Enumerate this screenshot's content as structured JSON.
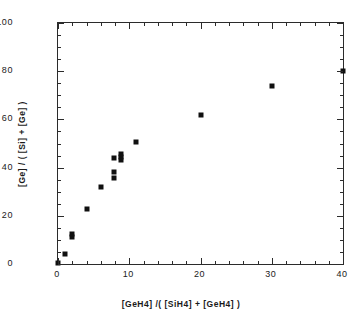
{
  "chart_data": {
    "type": "scatter",
    "title": "",
    "xlabel": "[GeH4] /( [SiH4] + [GeH4] )",
    "ylabel": "[Ge] / ( [Si] + [Ge] )",
    "xlim": [
      0,
      40
    ],
    "ylim": [
      0,
      100
    ],
    "xticks": [
      0,
      10,
      20,
      30,
      40
    ],
    "yticks": [
      0,
      20,
      40,
      60,
      80,
      100
    ],
    "xtick_labels": [
      "0",
      "10",
      "20",
      "30",
      "40"
    ],
    "ytick_labels": [
      "0",
      "20",
      "40",
      "60",
      "80",
      "100"
    ],
    "x_minor_interval": 2,
    "y_minor_interval": 5,
    "grid": false,
    "legend": null,
    "marker": {
      "shape": "square",
      "color": "#101010",
      "size_px": 5
    },
    "series": [
      {
        "name": "Ge incorporation",
        "points": [
          {
            "x": 0.0,
            "y": 0.5
          },
          {
            "x": 1.0,
            "y": 4.0
          },
          {
            "x": 2.0,
            "y": 11.0
          },
          {
            "x": 2.0,
            "y": 12.5
          },
          {
            "x": 4.0,
            "y": 23.0
          },
          {
            "x": 6.0,
            "y": 32.0
          },
          {
            "x": 7.8,
            "y": 35.5
          },
          {
            "x": 7.8,
            "y": 38.0
          },
          {
            "x": 7.8,
            "y": 44.0
          },
          {
            "x": 8.8,
            "y": 43.0
          },
          {
            "x": 8.8,
            "y": 44.5
          },
          {
            "x": 8.8,
            "y": 45.5
          },
          {
            "x": 11.0,
            "y": 50.5
          },
          {
            "x": 20.0,
            "y": 62.0
          },
          {
            "x": 30.0,
            "y": 74.0
          },
          {
            "x": 40.0,
            "y": 80.0
          }
        ]
      }
    ]
  },
  "figure": {
    "background": "#ffffff",
    "axis_color": "#2b2b2b"
  }
}
